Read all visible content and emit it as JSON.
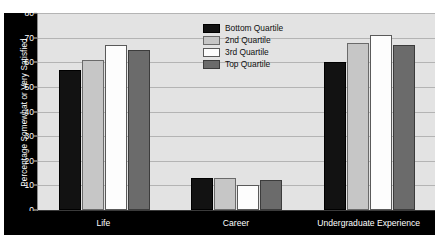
{
  "chart_data": {
    "type": "bar",
    "title": "",
    "xlabel": "",
    "ylabel": "Percentage Somewhat or Very Satisfied",
    "ylim": [
      0,
      80
    ],
    "yticks": [
      0,
      10,
      20,
      30,
      40,
      50,
      60,
      70,
      80
    ],
    "grid": true,
    "legend_position": "top-center-right",
    "categories": [
      "Life",
      "Career",
      "Undergraduate Experience"
    ],
    "series": [
      {
        "name": "Bottom Quartile",
        "color": "#121212",
        "values": [
          57,
          13,
          60
        ]
      },
      {
        "name": "2nd Quartile",
        "color": "#c6c6c6",
        "values": [
          61,
          13,
          68
        ]
      },
      {
        "name": "3rd Quartile",
        "color": "#fdfdfd",
        "values": [
          67,
          10,
          71
        ]
      },
      {
        "name": "Top Quartile",
        "color": "#6b6b6b",
        "values": [
          65,
          12,
          67
        ]
      }
    ]
  },
  "legend": {
    "items": [
      {
        "label": "Bottom Quartile"
      },
      {
        "label": "2nd Quartile"
      },
      {
        "label": "3rd Quartile"
      },
      {
        "label": "Top Quartile"
      }
    ]
  },
  "colors": {
    "plot_background": "#e3e3e3",
    "axis_band": "#000000",
    "gridline": "#b4b4b4",
    "tick_label": "#ffffff"
  }
}
